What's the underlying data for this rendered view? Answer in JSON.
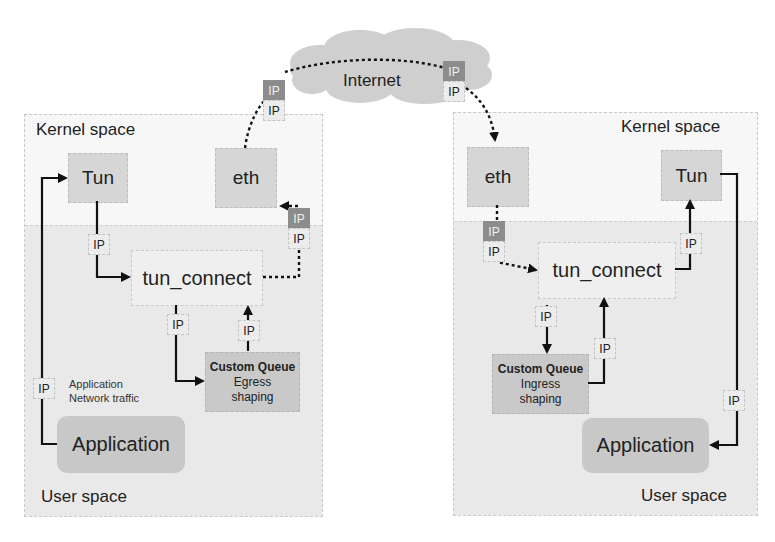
{
  "internet": {
    "label": "Internet"
  },
  "left_host": {
    "kernel_label": "Kernel space",
    "user_label": "User space",
    "tun": "Tun",
    "eth": "eth",
    "tun_connect": "tun_connect",
    "queue": {
      "title": "Custom Queue",
      "line1": "Egress",
      "line2": "shaping"
    },
    "application": "Application",
    "note": {
      "line1": "Application",
      "line2": "Network traffic"
    },
    "ip_label": "IP"
  },
  "right_host": {
    "kernel_label": "Kernel space",
    "user_label": "User space",
    "tun": "Tun",
    "eth": "eth",
    "tun_connect": "tun_connect",
    "queue": {
      "title": "Custom Queue",
      "line1": "Ingress",
      "line2": "shaping"
    },
    "application": "Application",
    "ip_label": "IP"
  },
  "colors": {
    "panel_bg": "#f7f7f7",
    "user_bg": "#e9e9e9",
    "box_bg": "#d6d6d6",
    "ip_outer": "#8c8c8c",
    "wire": "#111111"
  }
}
